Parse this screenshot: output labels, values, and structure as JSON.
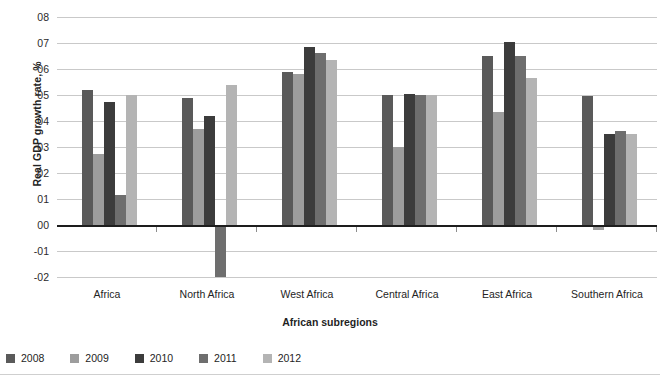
{
  "chart_data": {
    "type": "bar",
    "title": "",
    "xlabel": "African subregions",
    "ylabel": "Real GDP growth rate, %",
    "categories": [
      "Africa",
      "North Africa",
      "West Africa",
      "Central Africa",
      "East Africa",
      "Southern Africa"
    ],
    "ylim": [
      -2,
      8
    ],
    "ytick_labels": [
      "08",
      "07",
      "06",
      "05",
      "04",
      "03",
      "02",
      "01",
      "00",
      "-01",
      "-02"
    ],
    "ytick_values": [
      8,
      7,
      6,
      5,
      4,
      3,
      2,
      1,
      0,
      -1,
      -2
    ],
    "grid": true,
    "legend_position": "bottom-left",
    "series": [
      {
        "name": "2008",
        "color": "#5a5a5a",
        "values": [
          5.2,
          4.9,
          5.9,
          5.0,
          6.5,
          4.95
        ]
      },
      {
        "name": "2009",
        "color": "#9d9d9d",
        "values": [
          2.75,
          3.7,
          5.8,
          3.0,
          4.35,
          -0.2
        ]
      },
      {
        "name": "2010",
        "color": "#3c3c3c",
        "values": [
          4.75,
          4.2,
          6.85,
          5.05,
          7.05,
          3.5
        ]
      },
      {
        "name": "2011",
        "color": "#6e6e6e",
        "values": [
          1.15,
          -2.0,
          6.6,
          5.0,
          6.5,
          3.6
        ]
      },
      {
        "name": "2012",
        "color": "#b4b4b4",
        "values": [
          5.0,
          5.4,
          6.35,
          5.0,
          5.65,
          3.5
        ]
      }
    ]
  },
  "legend": {
    "items": [
      {
        "label": "2008"
      },
      {
        "label": "2009"
      },
      {
        "label": "2010"
      },
      {
        "label": "2011"
      },
      {
        "label": "2012"
      }
    ]
  }
}
